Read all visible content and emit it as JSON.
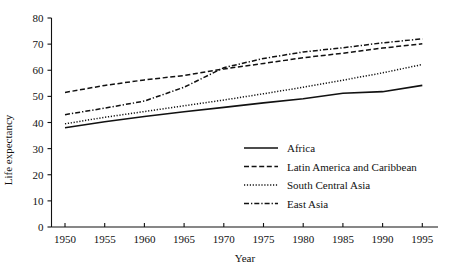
{
  "chart_data": {
    "type": "line",
    "title": "",
    "xlabel": "Year",
    "ylabel": "Life expectancy",
    "xlim": [
      1948,
      1997
    ],
    "ylim": [
      0,
      80
    ],
    "grid": false,
    "legend_position": "inside-lower-right",
    "x": [
      1950,
      1955,
      1960,
      1965,
      1970,
      1975,
      1980,
      1985,
      1990,
      1995
    ],
    "xticks": [
      "1950",
      "1955",
      "1960",
      "1965",
      "1970",
      "1975",
      "1980",
      "1985",
      "1990",
      "1995"
    ],
    "yticks": [
      "0",
      "10",
      "20",
      "30",
      "40",
      "50",
      "60",
      "70",
      "80"
    ],
    "series": [
      {
        "name": "Africa",
        "style": "solid",
        "values": [
          38.0,
          40.3,
          42.3,
          44.1,
          45.8,
          47.5,
          49.1,
          51.2,
          51.8,
          54.2
        ]
      },
      {
        "name": "Latin America and Caribbean",
        "style": "dashed",
        "values": [
          51.5,
          54.2,
          56.3,
          58.0,
          60.5,
          62.6,
          64.8,
          66.5,
          68.5,
          70.1
        ]
      },
      {
        "name": "South Central Asia",
        "style": "dotted",
        "values": [
          39.5,
          42.0,
          44.2,
          46.4,
          48.6,
          51.0,
          53.5,
          56.2,
          59.0,
          62.2
        ]
      },
      {
        "name": "East Asia",
        "style": "dashdot",
        "values": [
          43.0,
          45.5,
          48.2,
          53.5,
          61.0,
          64.5,
          67.0,
          68.6,
          70.5,
          72.0
        ]
      }
    ]
  },
  "axes": {
    "y_title": "Life expectancy",
    "x_title": "Year",
    "y_tick_labels": [
      "0",
      "10",
      "20",
      "30",
      "40",
      "50",
      "60",
      "70",
      "80"
    ],
    "x_tick_labels": [
      "1950",
      "1955",
      "1960",
      "1965",
      "1970",
      "1975",
      "1980",
      "1985",
      "1990",
      "1995"
    ]
  },
  "legend": {
    "items": [
      {
        "label": "Africa",
        "style": "solid"
      },
      {
        "label": "Latin America and Caribbean",
        "style": "dashed"
      },
      {
        "label": "South Central Asia",
        "style": "dotted"
      },
      {
        "label": "East Asia",
        "style": "dashdot"
      }
    ]
  },
  "colors": {
    "ink": "#111111",
    "background": "#ffffff"
  }
}
